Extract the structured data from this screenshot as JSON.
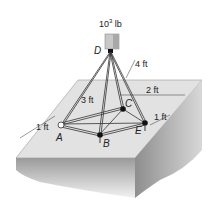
{
  "load": {
    "value": "10",
    "exp": "3",
    "unit": " lb"
  },
  "points": {
    "D": "D",
    "A": "A",
    "B": "B",
    "C": "C",
    "E": "E"
  },
  "dims": {
    "d4": "4 ft",
    "d3": "3 ft",
    "d2": "2 ft",
    "d1_left": "1 ft",
    "d1_right": "1 ft"
  },
  "colors": {
    "slab_top": "#e4e4e4",
    "slab_front": "#bdbdbd",
    "slab_side": "#9e9e9e",
    "members": "#333333"
  }
}
